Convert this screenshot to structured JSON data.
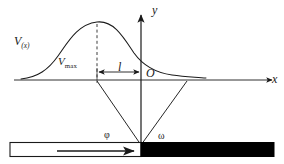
{
  "figure": {
    "background_color": "#ffffff",
    "stroke_color": "#1a1a1a",
    "bar_fill_color": "#000000",
    "labels": {
      "curve": {
        "base": "V",
        "sub": "(x)"
      },
      "peak": {
        "base": "V",
        "sub": "max"
      },
      "distance": "l",
      "origin": "O",
      "y_axis": "y",
      "x_axis": "x",
      "angle_left": "φ",
      "angle_right": "ω"
    },
    "geometry": {
      "x_axis_y": 80,
      "y_axis_x": 141,
      "x_axis_start": 14,
      "x_axis_end": 278,
      "y_axis_top": 14,
      "y_axis_bottom": 145,
      "curve_peak_x": 97,
      "curve_peak_y": 22,
      "curve_start_x": 21,
      "curve_end_x": 206,
      "vertex_x": 141,
      "vertex_y": 145,
      "left_ray_x": 97,
      "right_ray_x": 187,
      "bar_top": 142,
      "bar_bottom": 157,
      "bar_left": 10,
      "bar_right": 274,
      "bar_split_x": 141,
      "inner_arrow_y": 151,
      "inner_arrow_start": 57,
      "inner_arrow_end": 136
    }
  }
}
